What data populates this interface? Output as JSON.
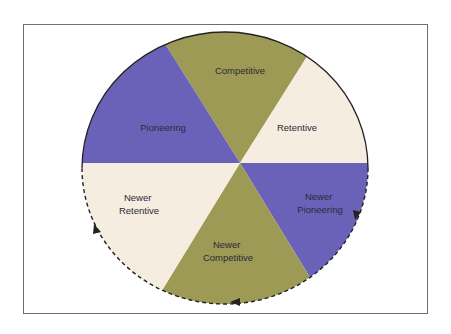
{
  "diagram": {
    "type": "cycle-wheel",
    "colors": {
      "competitive": "#9c9a55",
      "pioneering": "#6a62b8",
      "retentive": "#f5ede0",
      "outline": "#222222",
      "frame": "#6e6e6e"
    },
    "segments": [
      {
        "id": "competitive",
        "lines": [
          "Competitive"
        ]
      },
      {
        "id": "retentive",
        "lines": [
          "Retentive"
        ]
      },
      {
        "id": "newer-pioneering",
        "lines": [
          "Newer",
          "Pioneering"
        ]
      },
      {
        "id": "newer-competitive",
        "lines": [
          "Newer",
          "Competitive"
        ]
      },
      {
        "id": "newer-retentive",
        "lines": [
          "Newer",
          "Retentive"
        ]
      },
      {
        "id": "pioneering",
        "lines": [
          "Pioneering"
        ]
      }
    ],
    "cycle_direction": "clockwise dashed arrows around lower half"
  }
}
